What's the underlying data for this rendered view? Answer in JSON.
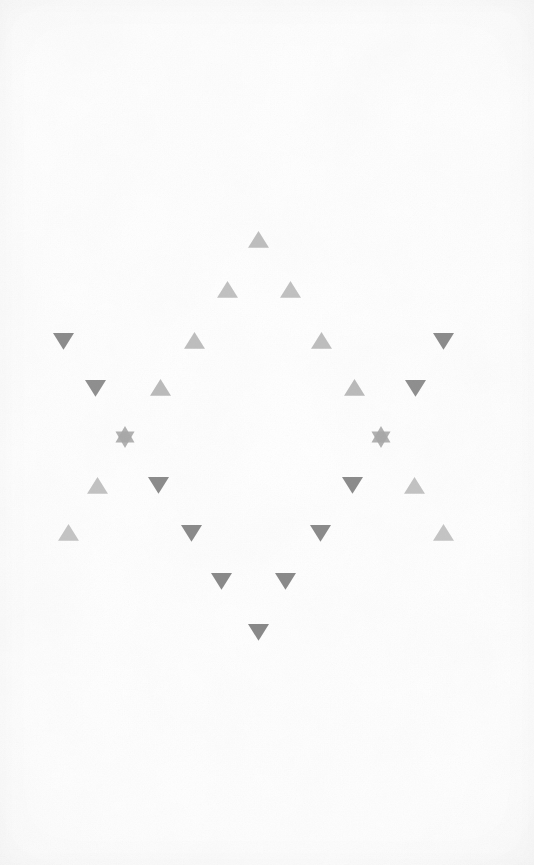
{
  "figure": {
    "background_color": "#fdfdfd",
    "width": 534,
    "height": 865
  },
  "palette": {
    "light_gray": "#c4c4c4",
    "mid_gray": "#b0b0b0",
    "dark_gray": "#8f8f8f",
    "darker_gray": "#858585",
    "paper": "#fdfdfd",
    "paper_edge": "#f4f4f4"
  },
  "chart_data": {
    "type": "scatter",
    "xlabel": "",
    "ylabel": "",
    "xlim": [
      0,
      534
    ],
    "ylim": [
      0,
      865
    ],
    "grid": false,
    "legend": "none",
    "marker_count": 24,
    "marker_kinds": [
      "triangle-up",
      "triangle-down",
      "six-pointed-star"
    ],
    "markers": [
      {
        "id": "m01",
        "kind": "triangle-up",
        "x": 258,
        "y": 239,
        "size": 21,
        "color": "#c0c0c0",
        "row": 1
      },
      {
        "id": "m02",
        "kind": "triangle-up",
        "x": 227,
        "y": 289,
        "size": 21,
        "color": "#c2c2c2",
        "row": 2
      },
      {
        "id": "m03",
        "kind": "triangle-up",
        "x": 290,
        "y": 289,
        "size": 21,
        "color": "#c2c2c2",
        "row": 2
      },
      {
        "id": "m04",
        "kind": "triangle-down",
        "x": 63,
        "y": 341,
        "size": 21,
        "color": "#8d8d8d",
        "row": 3
      },
      {
        "id": "m05",
        "kind": "triangle-up",
        "x": 194,
        "y": 340,
        "size": 21,
        "color": "#bfbfbf",
        "row": 3
      },
      {
        "id": "m06",
        "kind": "triangle-up",
        "x": 321,
        "y": 340,
        "size": 21,
        "color": "#bfbfbf",
        "row": 3
      },
      {
        "id": "m07",
        "kind": "triangle-down",
        "x": 443,
        "y": 341,
        "size": 21,
        "color": "#8d8d8d",
        "row": 3
      },
      {
        "id": "m08",
        "kind": "triangle-down",
        "x": 95,
        "y": 388,
        "size": 21,
        "color": "#909090",
        "row": 4
      },
      {
        "id": "m09",
        "kind": "triangle-up",
        "x": 160,
        "y": 387,
        "size": 21,
        "color": "#bcbcbc",
        "row": 4
      },
      {
        "id": "m10",
        "kind": "triangle-up",
        "x": 354,
        "y": 387,
        "size": 21,
        "color": "#bcbcbc",
        "row": 4
      },
      {
        "id": "m11",
        "kind": "triangle-down",
        "x": 415,
        "y": 388,
        "size": 21,
        "color": "#909090",
        "row": 4
      },
      {
        "id": "m12",
        "kind": "star-six",
        "x": 125,
        "y": 437,
        "size": 22,
        "color": "#a8a8a8",
        "row": 5
      },
      {
        "id": "m13",
        "kind": "star-six",
        "x": 381,
        "y": 437,
        "size": 22,
        "color": "#a8a8a8",
        "row": 5
      },
      {
        "id": "m14",
        "kind": "triangle-up",
        "x": 97,
        "y": 485,
        "size": 21,
        "color": "#c4c4c4",
        "row": 6
      },
      {
        "id": "m15",
        "kind": "triangle-down",
        "x": 158,
        "y": 485,
        "size": 21,
        "color": "#8d8d8d",
        "row": 6
      },
      {
        "id": "m16",
        "kind": "triangle-down",
        "x": 352,
        "y": 485,
        "size": 21,
        "color": "#8d8d8d",
        "row": 6
      },
      {
        "id": "m17",
        "kind": "triangle-up",
        "x": 414,
        "y": 485,
        "size": 21,
        "color": "#c4c4c4",
        "row": 6
      },
      {
        "id": "m18",
        "kind": "triangle-up",
        "x": 68,
        "y": 532,
        "size": 21,
        "color": "#c6c6c6",
        "row": 7
      },
      {
        "id": "m19",
        "kind": "triangle-down",
        "x": 191,
        "y": 533,
        "size": 21,
        "color": "#8c8c8c",
        "row": 7
      },
      {
        "id": "m20",
        "kind": "triangle-down",
        "x": 320,
        "y": 533,
        "size": 21,
        "color": "#8c8c8c",
        "row": 7
      },
      {
        "id": "m21",
        "kind": "triangle-up",
        "x": 443,
        "y": 532,
        "size": 21,
        "color": "#c6c6c6",
        "row": 7
      },
      {
        "id": "m22",
        "kind": "triangle-down",
        "x": 221,
        "y": 581,
        "size": 21,
        "color": "#8b8b8b",
        "row": 8
      },
      {
        "id": "m23",
        "kind": "triangle-down",
        "x": 285,
        "y": 581,
        "size": 21,
        "color": "#8b8b8b",
        "row": 8
      },
      {
        "id": "m24",
        "kind": "triangle-down",
        "x": 258,
        "y": 632,
        "size": 21,
        "color": "#8a8a8a",
        "row": 9
      }
    ]
  }
}
